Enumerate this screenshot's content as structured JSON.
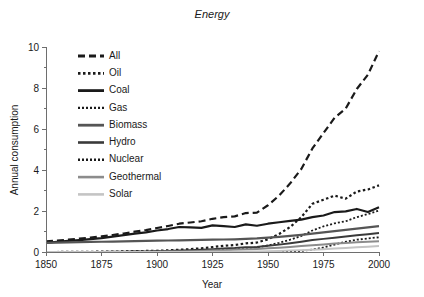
{
  "chart_data": {
    "type": "line",
    "title": "Energy",
    "xlabel": "Year",
    "ylabel": "Annual consumption",
    "xlim": [
      1850,
      2000
    ],
    "ylim": [
      0,
      10
    ],
    "xticks": [
      1850,
      1875,
      1900,
      1925,
      1950,
      1975,
      2000
    ],
    "yticks": [
      0,
      2,
      4,
      6,
      8,
      10
    ],
    "xtick_labels": [
      "1850",
      "1875",
      "1900",
      "1925",
      "1950",
      "1975",
      "2000"
    ],
    "ytick_labels": [
      "0",
      "2",
      "4",
      "6",
      "8",
      "10"
    ],
    "grid": false,
    "legend_position": "upper-left-inside",
    "x": [
      1850,
      1855,
      1860,
      1865,
      1870,
      1875,
      1880,
      1885,
      1890,
      1895,
      1900,
      1905,
      1910,
      1915,
      1920,
      1925,
      1930,
      1935,
      1940,
      1945,
      1950,
      1955,
      1960,
      1965,
      1970,
      1975,
      1980,
      1985,
      1990,
      1995,
      2000
    ],
    "series": [
      {
        "name": "All",
        "style": "dashed",
        "color": "#1a1a1a",
        "width": 2.2,
        "dash": "7,4",
        "values": [
          0.52,
          0.56,
          0.6,
          0.65,
          0.7,
          0.76,
          0.83,
          0.9,
          0.99,
          1.07,
          1.17,
          1.27,
          1.38,
          1.44,
          1.5,
          1.62,
          1.7,
          1.74,
          1.9,
          1.92,
          2.28,
          2.75,
          3.35,
          4.05,
          5.05,
          5.8,
          6.55,
          7.0,
          7.95,
          8.65,
          9.8
        ]
      },
      {
        "name": "Oil",
        "style": "dotted",
        "color": "#1a1a1a",
        "width": 2.2,
        "dash": "2.5,2.5",
        "values": [
          0.0,
          0.0,
          0.01,
          0.01,
          0.01,
          0.02,
          0.02,
          0.03,
          0.04,
          0.05,
          0.06,
          0.08,
          0.11,
          0.14,
          0.18,
          0.24,
          0.3,
          0.34,
          0.42,
          0.46,
          0.62,
          0.88,
          1.22,
          1.7,
          2.35,
          2.55,
          2.75,
          2.6,
          2.95,
          3.05,
          3.25
        ]
      },
      {
        "name": "Coal",
        "style": "solid",
        "color": "#1a1a1a",
        "width": 2.2,
        "dash": "none",
        "values": [
          0.45,
          0.5,
          0.54,
          0.58,
          0.63,
          0.68,
          0.75,
          0.82,
          0.9,
          0.96,
          1.05,
          1.12,
          1.22,
          1.2,
          1.18,
          1.3,
          1.26,
          1.22,
          1.35,
          1.28,
          1.38,
          1.45,
          1.52,
          1.58,
          1.7,
          1.78,
          1.95,
          1.98,
          2.1,
          1.95,
          2.18
        ]
      },
      {
        "name": "Gas",
        "style": "dotted",
        "color": "#1a1a1a",
        "width": 1.8,
        "dash": "2,2",
        "values": [
          0.0,
          0.0,
          0.0,
          0.0,
          0.0,
          0.01,
          0.01,
          0.01,
          0.02,
          0.02,
          0.03,
          0.04,
          0.05,
          0.06,
          0.08,
          0.1,
          0.12,
          0.14,
          0.18,
          0.22,
          0.32,
          0.45,
          0.6,
          0.78,
          1.05,
          1.25,
          1.4,
          1.5,
          1.7,
          1.85,
          2.02
        ]
      },
      {
        "name": "Biomass",
        "style": "solid",
        "color": "#555555",
        "width": 2.2,
        "dash": "none",
        "values": [
          0.45,
          0.46,
          0.47,
          0.48,
          0.49,
          0.5,
          0.51,
          0.52,
          0.53,
          0.54,
          0.55,
          0.56,
          0.57,
          0.58,
          0.59,
          0.6,
          0.61,
          0.62,
          0.64,
          0.66,
          0.7,
          0.74,
          0.79,
          0.84,
          0.9,
          0.96,
          1.02,
          1.08,
          1.14,
          1.2,
          1.26
        ]
      },
      {
        "name": "Hydro",
        "style": "solid",
        "color": "#3a3a3a",
        "width": 2.0,
        "dash": "none",
        "values": [
          0.0,
          0.0,
          0.0,
          0.0,
          0.0,
          0.0,
          0.01,
          0.01,
          0.02,
          0.03,
          0.04,
          0.05,
          0.07,
          0.09,
          0.11,
          0.14,
          0.17,
          0.19,
          0.23,
          0.25,
          0.3,
          0.36,
          0.43,
          0.5,
          0.58,
          0.64,
          0.7,
          0.76,
          0.82,
          0.87,
          0.93
        ]
      },
      {
        "name": "Nuclear",
        "style": "dotted",
        "color": "#1a1a1a",
        "width": 1.8,
        "dash": "2,2",
        "values": [
          0.0,
          0.0,
          0.0,
          0.0,
          0.0,
          0.0,
          0.0,
          0.0,
          0.0,
          0.0,
          0.0,
          0.0,
          0.0,
          0.0,
          0.0,
          0.0,
          0.0,
          0.0,
          0.0,
          0.0,
          0.0,
          0.01,
          0.02,
          0.05,
          0.12,
          0.22,
          0.36,
          0.5,
          0.6,
          0.66,
          0.72
        ]
      },
      {
        "name": "Geothermal",
        "style": "solid",
        "color": "#8c8c8c",
        "width": 2.0,
        "dash": "none",
        "values": [
          0.0,
          0.0,
          0.0,
          0.0,
          0.0,
          0.0,
          0.0,
          0.0,
          0.0,
          0.01,
          0.01,
          0.02,
          0.03,
          0.04,
          0.05,
          0.07,
          0.09,
          0.11,
          0.13,
          0.15,
          0.18,
          0.21,
          0.25,
          0.29,
          0.33,
          0.37,
          0.41,
          0.44,
          0.47,
          0.5,
          0.53
        ]
      },
      {
        "name": "Solar",
        "style": "solid",
        "color": "#c4c4c4",
        "width": 2.0,
        "dash": "none",
        "values": [
          0.0,
          0.0,
          0.0,
          0.0,
          0.0,
          0.0,
          0.0,
          0.0,
          0.0,
          0.0,
          0.0,
          0.0,
          0.0,
          0.0,
          0.0,
          0.01,
          0.01,
          0.02,
          0.02,
          0.03,
          0.04,
          0.05,
          0.07,
          0.09,
          0.11,
          0.14,
          0.17,
          0.2,
          0.23,
          0.26,
          0.29
        ]
      }
    ]
  },
  "legend": {
    "entries": [
      {
        "label": "All"
      },
      {
        "label": "Oil"
      },
      {
        "label": "Coal"
      },
      {
        "label": "Gas"
      },
      {
        "label": "Biomass"
      },
      {
        "label": "Hydro"
      },
      {
        "label": "Nuclear"
      },
      {
        "label": "Geothermal"
      },
      {
        "label": "Solar"
      }
    ]
  },
  "colors": {
    "background": "#ffffff",
    "axis": "#6e6e6e",
    "text": "#1a1a1a"
  }
}
